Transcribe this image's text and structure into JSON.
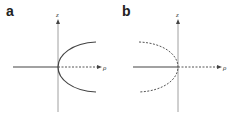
{
  "panels": [
    {
      "label": "a",
      "vertical_axis": "z",
      "horizontal_axis": "ρ",
      "curve_style": "solid"
    },
    {
      "label": "b",
      "vertical_axis": "z",
      "horizontal_axis": "ρ",
      "curve_style": "dashed"
    }
  ],
  "colors": {
    "line": "#555555",
    "axis": "#777777"
  }
}
